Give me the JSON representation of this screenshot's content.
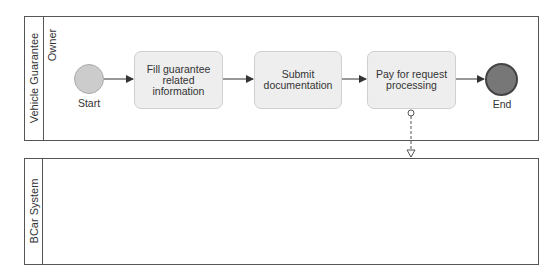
{
  "pools": [
    {
      "name": "Vehicle Guarantee",
      "lanes": [
        {
          "name": "Owner"
        }
      ]
    },
    {
      "name": "BCar System",
      "lanes": []
    }
  ],
  "events": {
    "start": {
      "label": "Start",
      "fill": "#cccccc",
      "stroke": "#aaaaaa"
    },
    "end": {
      "label": "End",
      "fill": "#777777",
      "stroke": "#444444"
    }
  },
  "tasks": [
    {
      "label": "Fill guarantee related information"
    },
    {
      "label": "Submit documentation"
    },
    {
      "label": "Pay for request processing"
    }
  ],
  "flows": {
    "sequence": [
      "Start → Fill guarantee related information",
      "Fill guarantee related information → Submit documentation",
      "Submit documentation → Pay for request processing",
      "Pay for request processing → End"
    ],
    "message": [
      "Pay for request processing → BCar System"
    ]
  },
  "colors": {
    "task_fill": "#eeeeee",
    "task_border": "#d0d0d0",
    "pool_border": "#555555",
    "arrow": "#333333"
  }
}
